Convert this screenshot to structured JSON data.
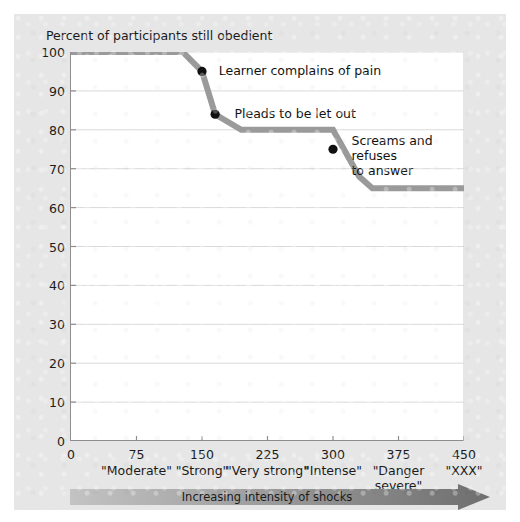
{
  "figure": {
    "y_axis_title": "Percent of participants still obedient",
    "arrow_caption": "Increasing intensity of shocks",
    "line_color": "#9a9a9a",
    "marker_color": "#111111",
    "grid_color": "#d9d9d9",
    "axis_color": "#8e8e8e",
    "panel_color": "#e6e6e6"
  },
  "chart_data": {
    "type": "line",
    "title": "",
    "xlabel": "Increasing intensity of shocks",
    "ylabel": "Percent of participants still obedient",
    "xlim": [
      0,
      450
    ],
    "ylim": [
      0,
      100
    ],
    "grid": true,
    "legend": "none",
    "x_ticks": [
      0,
      75,
      150,
      225,
      300,
      375,
      450
    ],
    "x_tick_labels": [
      "0",
      "75",
      "150",
      "225",
      "300",
      "375",
      "450"
    ],
    "x_category_labels": [
      "",
      "\"Moderate\"",
      "\"Strong\"",
      "\"Very\nstrong\"",
      "\"Intense\"",
      "\"Danger\nsevere\"",
      "\"XXX\""
    ],
    "y_ticks": [
      0,
      10,
      20,
      30,
      40,
      50,
      60,
      70,
      80,
      90,
      100
    ],
    "y_tick_labels": [
      "0",
      "10",
      "20",
      "30",
      "40",
      "50",
      "60",
      "70",
      "80",
      "90",
      "100"
    ],
    "series": [
      {
        "name": "Percent still obedient",
        "x": [
          0,
          128,
          150,
          165,
          195,
          300,
          330,
          345,
          450
        ],
        "y": [
          100,
          100,
          95,
          84,
          80,
          80,
          68,
          65,
          65
        ]
      }
    ],
    "markers": [
      {
        "x": 150,
        "y": 95,
        "label": "Learner complains of pain"
      },
      {
        "x": 165,
        "y": 84,
        "label": "Pleads to be let out"
      },
      {
        "x": 300,
        "y": 75,
        "label": "Screams and refuses\nto answer"
      }
    ],
    "annotations": [
      {
        "text": "Learner complains of pain",
        "x": 160,
        "y": 95
      },
      {
        "text": "Pleads to be let out",
        "x": 178,
        "y": 84
      },
      {
        "text": "Screams and refuses\nto answer",
        "x": 312,
        "y": 77
      }
    ]
  }
}
